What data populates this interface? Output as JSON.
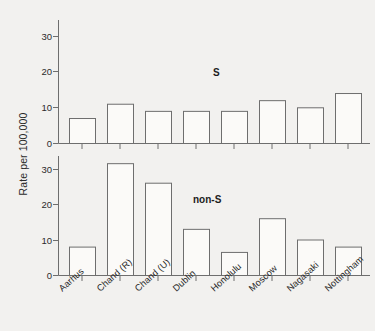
{
  "chart_data": {
    "type": "bar",
    "title": "",
    "xlabel": "",
    "ylabel": "Rate per 100,000",
    "categories": [
      "Aarhus",
      "Chand (R)",
      "Chand (U)",
      "Dublin",
      "Honolulu",
      "Moscow",
      "Nagasaki",
      "Nottingham"
    ],
    "panels": [
      {
        "name": "S",
        "label": "S",
        "values": [
          7,
          11,
          9,
          9,
          9,
          12,
          10,
          14
        ],
        "ylim": [
          0,
          34
        ],
        "yticks": [
          0,
          10,
          20,
          30
        ],
        "ytick_labels": [
          "0",
          "10",
          "20",
          "30"
        ],
        "grid": false
      },
      {
        "name": "non-S",
        "label": "non-S",
        "values": [
          8,
          31.5,
          26,
          13,
          6.5,
          16,
          10,
          8
        ],
        "ylim": [
          0,
          34
        ],
        "yticks": [
          0,
          10,
          20,
          30
        ],
        "ytick_labels": [
          "0",
          "10",
          "20",
          "30"
        ],
        "grid": false
      }
    ],
    "legend_position": "none",
    "annotations": [
      "S",
      "non-S"
    ],
    "bar_fill_color": "#fbfaf8",
    "bar_stroke_color": "#6e6e6e",
    "background_color": "#f2f1ef",
    "text_color": "#2b2b2b"
  },
  "axis": {
    "y_title": "Rate per 100,000"
  },
  "panel_top": {
    "label": "S",
    "tick_0": "0",
    "tick_10": "10",
    "tick_20": "20",
    "tick_30": "30"
  },
  "panel_bottom": {
    "label": "non-S",
    "tick_0": "0",
    "tick_10": "10",
    "tick_20": "20",
    "tick_30": "30"
  },
  "categories": {
    "c0": "Aarhus",
    "c1": "Chand (R)",
    "c2": "Chand (U)",
    "c3": "Dublin",
    "c4": "Honolulu",
    "c5": "Moscow",
    "c6": "Nagasaki",
    "c7": "Nottingham"
  }
}
